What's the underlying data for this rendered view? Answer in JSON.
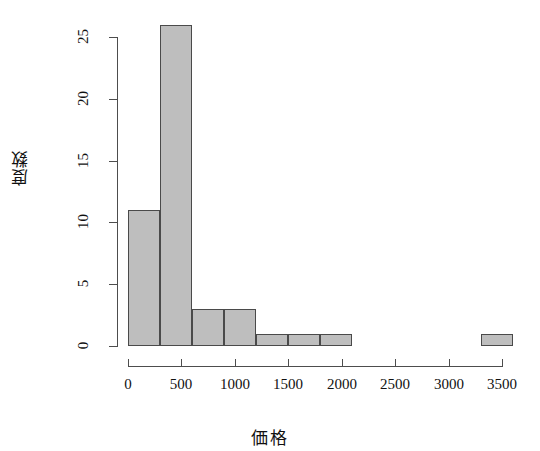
{
  "chart_data": {
    "type": "bar",
    "title": "",
    "xlabel": "価格",
    "ylabel": "度数",
    "xlim": [
      0,
      3600
    ],
    "ylim": [
      0,
      26
    ],
    "bin_width": 300,
    "grid": false,
    "legend": null,
    "bar_fill_color": "#bebebe",
    "bar_border_color": "#4a4a4a",
    "axis_color": "#4d4d4d",
    "background_color": "#ffffff",
    "x_ticks": [
      {
        "value": 0,
        "label": "0"
      },
      {
        "value": 500,
        "label": "500"
      },
      {
        "value": 1000,
        "label": "1000"
      },
      {
        "value": 1500,
        "label": "1500"
      },
      {
        "value": 2000,
        "label": "2000"
      },
      {
        "value": 2500,
        "label": "2500"
      },
      {
        "value": 3000,
        "label": "3000"
      },
      {
        "value": 3500,
        "label": "3500"
      }
    ],
    "y_ticks": [
      {
        "value": 0,
        "label": "0"
      },
      {
        "value": 5,
        "label": "5"
      },
      {
        "value": 10,
        "label": "10"
      },
      {
        "value": 15,
        "label": "15"
      },
      {
        "value": 20,
        "label": "20"
      },
      {
        "value": 25,
        "label": "25"
      }
    ],
    "bins": [
      {
        "x0": 0,
        "x1": 300,
        "count": 11
      },
      {
        "x0": 300,
        "x1": 600,
        "count": 26
      },
      {
        "x0": 600,
        "x1": 900,
        "count": 3
      },
      {
        "x0": 900,
        "x1": 1200,
        "count": 3
      },
      {
        "x0": 1200,
        "x1": 1500,
        "count": 1
      },
      {
        "x0": 1500,
        "x1": 1800,
        "count": 1
      },
      {
        "x0": 1800,
        "x1": 2100,
        "count": 1
      },
      {
        "x0": 2100,
        "x1": 2400,
        "count": 0
      },
      {
        "x0": 2400,
        "x1": 2700,
        "count": 0
      },
      {
        "x0": 2700,
        "x1": 3000,
        "count": 0
      },
      {
        "x0": 3000,
        "x1": 3300,
        "count": 0
      },
      {
        "x0": 3300,
        "x1": 3600,
        "count": 1
      }
    ],
    "categories": [
      "0-300",
      "300-600",
      "600-900",
      "900-1200",
      "1200-1500",
      "1500-1800",
      "1800-2100",
      "2100-2400",
      "2400-2700",
      "2700-3000",
      "3000-3300",
      "3300-3600"
    ],
    "values": [
      11,
      26,
      3,
      3,
      1,
      1,
      1,
      0,
      0,
      0,
      0,
      1
    ]
  }
}
